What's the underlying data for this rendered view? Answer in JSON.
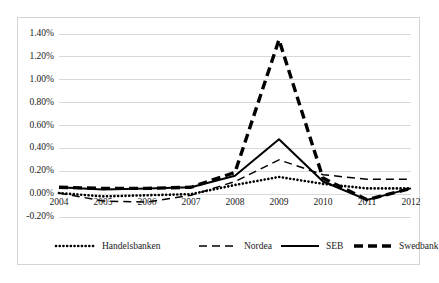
{
  "chart_data": {
    "type": "line",
    "title": "",
    "subtitle": "",
    "xlabel": "",
    "ylabel": "",
    "categories": [
      "2004",
      "2005",
      "2006",
      "2007",
      "2008",
      "2009",
      "2010",
      "2011",
      "2012"
    ],
    "x": [
      2004,
      2005,
      2006,
      2007,
      2008,
      2009,
      2010,
      2011,
      2012
    ],
    "ylim": [
      -0.2,
      1.4
    ],
    "ytick_values": [
      1.4,
      1.2,
      1.0,
      0.8,
      0.6,
      0.4,
      0.2,
      0.0,
      -0.2
    ],
    "ytick_labels": [
      "1.40%",
      "1.20%",
      "1.00%",
      "0.80%",
      "0.60%",
      "0.40%",
      "0.20%",
      "0.00%",
      "-0.20%"
    ],
    "xtick_labels": [
      "2004",
      "2005",
      "2006",
      "2007",
      "2008",
      "2009",
      "2010",
      "2011",
      "2012"
    ],
    "grid": "horizontal",
    "legend_position": "bottom",
    "value_unit": "percent",
    "series": [
      {
        "name": "Handelsbanken",
        "style": "dotted",
        "color": "#000000",
        "values": [
          0.01,
          -0.02,
          -0.01,
          0.0,
          0.08,
          0.15,
          0.09,
          0.05,
          0.05
        ]
      },
      {
        "name": "Nordea",
        "style": "dashed",
        "color": "#000000",
        "values": [
          0.01,
          -0.06,
          -0.07,
          -0.01,
          0.11,
          0.3,
          0.17,
          0.13,
          0.13
        ]
      },
      {
        "name": "SEB",
        "style": "solid",
        "color": "#000000",
        "values": [
          0.06,
          0.04,
          0.05,
          0.06,
          0.16,
          0.48,
          0.11,
          -0.05,
          0.05
        ]
      },
      {
        "name": "Swedbank",
        "style": "thick-dashed",
        "color": "#000000",
        "values": [
          0.06,
          0.05,
          0.05,
          0.06,
          0.19,
          1.35,
          0.14,
          -0.05,
          0.05
        ]
      }
    ]
  },
  "legend": {
    "items": [
      {
        "label": "Handelsbanken",
        "style": "dotted"
      },
      {
        "label": "Nordea",
        "style": "dashed"
      },
      {
        "label": "SEB",
        "style": "solid"
      },
      {
        "label": "Swedbank",
        "style": "thick-dashed"
      }
    ]
  },
  "colors": {
    "series": "#000000",
    "gridline": "#d9d9d9",
    "border": "#d4d4d4",
    "background": "#ffffff",
    "text": "#1a1a1a"
  }
}
